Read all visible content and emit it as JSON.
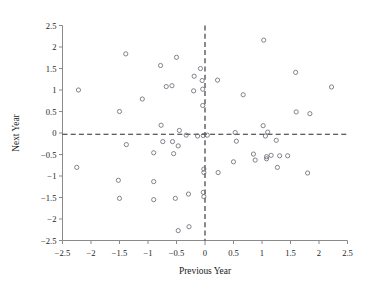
{
  "chart_data": {
    "type": "scatter",
    "title": "",
    "xlabel": "Previous Year",
    "ylabel": "Next Year",
    "xlim": [
      -2.5,
      2.5
    ],
    "ylim": [
      -2.5,
      2.5
    ],
    "xticks": [
      -2.5,
      -2,
      -1.5,
      -1,
      -0.5,
      0,
      0.5,
      1,
      1.5,
      2,
      2.5
    ],
    "yticks": [
      -2.5,
      -2,
      -1.5,
      -1,
      -0.5,
      0,
      0.5,
      1,
      1.5,
      2,
      2.5
    ],
    "xtick_labels": [
      "−2.5",
      "−2",
      "−1.5",
      "−1",
      "−0.5",
      "0",
      "0.5",
      "1",
      "1.5",
      "2",
      "2.5"
    ],
    "ytick_labels": [
      "−2.5",
      "−2",
      "−1.5",
      "−1",
      "−0.5",
      "0",
      "0.5",
      "1",
      "1.5",
      "2",
      "2.5"
    ],
    "grid": false,
    "legend": "none",
    "marker": "open-circle",
    "marker_color": "#6e6e78",
    "reference_lines": [
      {
        "type": "vertical",
        "value": 0,
        "style": "dashed",
        "color": "#2b2b2b"
      },
      {
        "type": "horizontal",
        "value": -0.03,
        "style": "dashed",
        "color": "#2b2b2b"
      }
    ],
    "points": [
      {
        "x": -2.22,
        "y": 1.0
      },
      {
        "x": -2.25,
        "y": -0.8
      },
      {
        "x": -1.5,
        "y": 0.5
      },
      {
        "x": -1.5,
        "y": -1.52
      },
      {
        "x": -1.52,
        "y": -1.1
      },
      {
        "x": -1.39,
        "y": 1.84
      },
      {
        "x": -1.38,
        "y": -0.27
      },
      {
        "x": -1.1,
        "y": 0.79
      },
      {
        "x": -0.9,
        "y": -0.46
      },
      {
        "x": -0.9,
        "y": -1.13
      },
      {
        "x": -0.9,
        "y": -1.55
      },
      {
        "x": -0.78,
        "y": 1.57
      },
      {
        "x": -0.77,
        "y": 0.18
      },
      {
        "x": -0.74,
        "y": -0.2
      },
      {
        "x": -0.68,
        "y": 1.08
      },
      {
        "x": -0.58,
        "y": 1.1
      },
      {
        "x": -0.57,
        "y": -0.2
      },
      {
        "x": -0.55,
        "y": -0.48
      },
      {
        "x": -0.52,
        "y": -1.52
      },
      {
        "x": -0.5,
        "y": 1.76
      },
      {
        "x": -0.47,
        "y": -0.3
      },
      {
        "x": -0.45,
        "y": 0.06
      },
      {
        "x": -0.47,
        "y": -2.27
      },
      {
        "x": -0.33,
        "y": -0.05
      },
      {
        "x": -0.29,
        "y": -1.42
      },
      {
        "x": -0.28,
        "y": -2.18
      },
      {
        "x": -0.19,
        "y": 1.32
      },
      {
        "x": -0.2,
        "y": 0.98
      },
      {
        "x": -0.13,
        "y": -0.07
      },
      {
        "x": -0.08,
        "y": 1.5
      },
      {
        "x": -0.05,
        "y": 1.22
      },
      {
        "x": -0.04,
        "y": 1.02
      },
      {
        "x": -0.04,
        "y": 0.64
      },
      {
        "x": -0.03,
        "y": -0.06
      },
      {
        "x": -0.02,
        "y": -0.84
      },
      {
        "x": -0.02,
        "y": -0.92
      },
      {
        "x": -0.03,
        "y": -1.38
      },
      {
        "x": -0.02,
        "y": -1.48
      },
      {
        "x": 0.04,
        "y": -0.05
      },
      {
        "x": 0.22,
        "y": 1.23
      },
      {
        "x": 0.23,
        "y": -0.92
      },
      {
        "x": 0.5,
        "y": -0.67
      },
      {
        "x": 0.53,
        "y": 0.01
      },
      {
        "x": 0.55,
        "y": -0.19
      },
      {
        "x": 0.67,
        "y": 0.89
      },
      {
        "x": 0.85,
        "y": -0.49
      },
      {
        "x": 0.88,
        "y": -0.63
      },
      {
        "x": 1.03,
        "y": 2.16
      },
      {
        "x": 1.02,
        "y": 0.17
      },
      {
        "x": 1.06,
        "y": -0.07
      },
      {
        "x": 1.08,
        "y": -0.55
      },
      {
        "x": 1.08,
        "y": -0.6
      },
      {
        "x": 1.1,
        "y": 0.02
      },
      {
        "x": 1.16,
        "y": -0.52
      },
      {
        "x": 1.25,
        "y": -0.17
      },
      {
        "x": 1.27,
        "y": -0.8
      },
      {
        "x": 1.31,
        "y": -0.53
      },
      {
        "x": 1.45,
        "y": -0.53
      },
      {
        "x": 1.59,
        "y": 1.41
      },
      {
        "x": 1.6,
        "y": 0.49
      },
      {
        "x": 1.8,
        "y": -0.93
      },
      {
        "x": 1.84,
        "y": 0.45
      },
      {
        "x": 2.22,
        "y": 1.07
      }
    ]
  }
}
